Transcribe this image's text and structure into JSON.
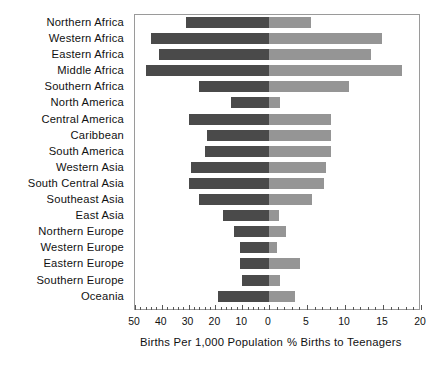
{
  "chart_data": {
    "type": "bar",
    "title": "",
    "subtitle": "",
    "orientation": "horizontal",
    "style": "back-to-back population pyramid (diverging bar chart)",
    "categories": [
      "Northern Africa",
      "Western Africa",
      "Eastern Africa",
      "Middle Africa",
      "Southern Africa",
      "North America",
      "Central America",
      "Caribbean",
      "South America",
      "Western Asia",
      "South Central Asia",
      "Southeast Asia",
      "East Asia",
      "Northern Europe",
      "Western Europe",
      "Eastern Europe",
      "Southern Europe",
      "Oceania"
    ],
    "series": [
      {
        "name": "Births Per 1,000 Population",
        "side": "left",
        "color": "#4a4a4a",
        "axis_label": "Births Per 1,000 Population",
        "axis_ticks": [
          50,
          40,
          30,
          20,
          10,
          0
        ],
        "axis_min": 0,
        "axis_max": 50,
        "axis_direction": "right-to-left",
        "values": [
          31,
          44,
          41,
          46,
          26,
          14,
          30,
          23,
          24,
          29,
          30,
          26,
          17,
          13,
          11,
          11,
          10,
          19
        ]
      },
      {
        "name": "% Births to Teenagers",
        "side": "right",
        "color": "#959595",
        "axis_label": "% Births to Teenagers",
        "axis_ticks": [
          0,
          5,
          10,
          15,
          20
        ],
        "axis_min": 0,
        "axis_max": 20,
        "axis_direction": "left-to-right",
        "values": [
          5.5,
          14.9,
          13.4,
          17.5,
          10.5,
          1.5,
          8.1,
          8.2,
          8.1,
          7.5,
          7.3,
          5.6,
          1.3,
          2.3,
          1.1,
          4.1,
          1.5,
          3.4
        ]
      }
    ],
    "grid": false,
    "legend": "none",
    "legend_position": "none"
  },
  "axis": {
    "left_title": "Births Per 1,000 Population",
    "right_title": "% Births to Teenagers",
    "left_ticks": [
      "50",
      "40",
      "30",
      "20",
      "10",
      "0"
    ],
    "right_ticks": [
      "5",
      "10",
      "15",
      "20"
    ]
  },
  "colors": {
    "left_bar": "#4a4a4a",
    "right_bar": "#959595",
    "frame": "#9a9a9a",
    "background": "#ffffff",
    "text": "#111111"
  }
}
